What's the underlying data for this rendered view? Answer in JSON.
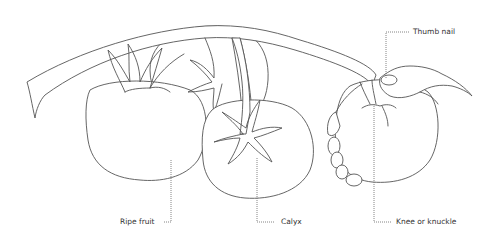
{
  "diagram": {
    "labels": {
      "thumb_nail": "Thumb nail",
      "ripe_fruit": "Ripe fruit",
      "calyx": "Calyx",
      "knee_or_knuckle": "Knee or knuckle"
    },
    "colors": {
      "line": "#555555",
      "background": "#ffffff",
      "text": "#333333"
    }
  }
}
